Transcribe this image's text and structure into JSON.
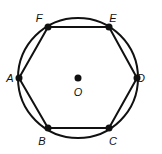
{
  "diagram": {
    "type": "regular hexagon inscribed in circle",
    "circle": {
      "cx": 78,
      "cy": 78,
      "r": 60
    },
    "center": {
      "label": "O",
      "x": 78,
      "y": 78,
      "label_x": 78,
      "label_y": 96
    },
    "vertices": [
      {
        "label": "A",
        "x": 19,
        "y": 78,
        "label_x": 10,
        "label_y": 82
      },
      {
        "label": "B",
        "x": 48,
        "y": 128,
        "label_x": 42,
        "label_y": 145
      },
      {
        "label": "C",
        "x": 109,
        "y": 128,
        "label_x": 113,
        "label_y": 145
      },
      {
        "label": "D",
        "x": 137,
        "y": 78,
        "label_x": 141,
        "label_y": 82
      },
      {
        "label": "E",
        "x": 109,
        "y": 27,
        "label_x": 113,
        "label_y": 22
      },
      {
        "label": "F",
        "x": 48,
        "y": 27,
        "label_x": 39,
        "label_y": 22
      }
    ],
    "colors": {
      "stroke": "#111111",
      "background": "#ffffff"
    }
  }
}
